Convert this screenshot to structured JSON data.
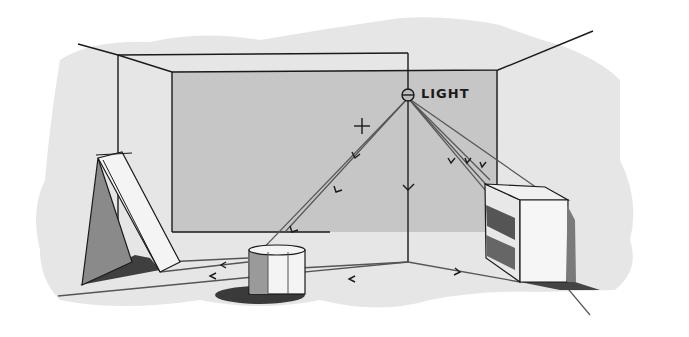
{
  "diagram": {
    "light_label": "LIGHT",
    "elements": [
      {
        "name": "light-source",
        "type": "point light",
        "position": "ceiling/back wall top"
      },
      {
        "name": "back-wall",
        "type": "rectangle",
        "shade": "mid gray"
      },
      {
        "name": "triangular-panel",
        "position": "left",
        "shade": "dark gray side, shadow on floor"
      },
      {
        "name": "cylinder",
        "position": "center floor",
        "shade": "shadow on floor"
      },
      {
        "name": "cabinet",
        "position": "right",
        "note": "open shelving box with shadow"
      },
      {
        "name": "crosshair-mark",
        "position": "left of light on back wall"
      }
    ],
    "colors": {
      "wash": "#e4e4e4",
      "back_wall": "#c9c9c9",
      "ink": "#1a1a1a",
      "ray": "#555555",
      "dark_shade": "#4a4a4a",
      "mid_shade": "#8a8a8a"
    }
  }
}
